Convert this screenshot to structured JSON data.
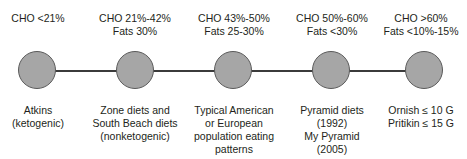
{
  "figure": {
    "type": "continuum-diagram",
    "colors": {
      "node_fill": "#a6a6a6",
      "node_stroke": "#5a5a5a",
      "connector": "#3b3b3b",
      "text": "#231f20",
      "background": "#ffffff"
    }
  },
  "nodes": [
    {
      "id": "node-1",
      "top_label": [
        "CHO <21%"
      ],
      "bottom_label": [
        "Atkins",
        "(ketogenic)"
      ]
    },
    {
      "id": "node-2",
      "top_label": [
        "CHO 21%-42%",
        "Fats 30%"
      ],
      "bottom_label": [
        "Zone diets and",
        "South Beach diets",
        "(nonketogenic)"
      ]
    },
    {
      "id": "node-3",
      "top_label": [
        "CHO 43%-50%",
        "Fats 25-30%"
      ],
      "bottom_label": [
        "Typical American",
        "or European",
        "population eating",
        "patterns"
      ]
    },
    {
      "id": "node-4",
      "top_label": [
        "CHO 50%-60%",
        "Fats <30%"
      ],
      "bottom_label": [
        "Pyramid diets",
        "(1992)",
        "My Pyramid",
        "(2005)"
      ]
    },
    {
      "id": "node-5",
      "top_label": [
        "CHO >60%",
        "Fats <10%-15%"
      ],
      "bottom_label": [
        "Ornish ≤ 10 G",
        "Pritikin ≤ 15 G"
      ]
    }
  ]
}
